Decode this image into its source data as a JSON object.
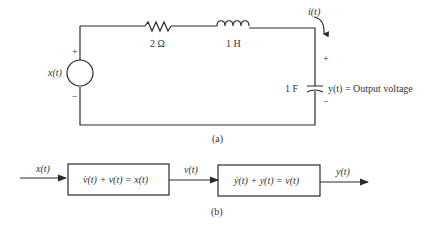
{
  "figure_a": {
    "caption": "(a)",
    "source": {
      "label": "x(t)",
      "plus": "+",
      "minus": "−"
    },
    "resistor": {
      "label": "2 Ω"
    },
    "inductor": {
      "label": "1 H"
    },
    "capacitor": {
      "label": "1 F",
      "plus": "+",
      "minus": "−"
    },
    "current": {
      "label": "i(t)"
    },
    "output": {
      "label": "y(t) = Output voltage"
    }
  },
  "figure_b": {
    "caption": "(b)",
    "input_label": "x(t)",
    "block1": {
      "equation": "v̇(t) + v(t) = x(t)"
    },
    "mid_label": "v(t)",
    "block2": {
      "equation": "ẏ(t) + y(t) = v(t)"
    },
    "output_label": "y(t)"
  },
  "colors": {
    "line": "#2a2a2a",
    "text": "#333333",
    "background": "#ffffff"
  }
}
